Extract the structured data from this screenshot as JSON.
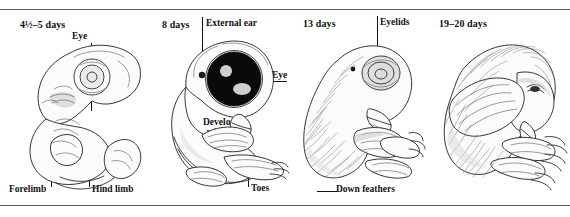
{
  "figure": {
    "background_color": "#ffffff",
    "rule_color": "#5a5a5a",
    "ink_color": "#2b2b2b"
  },
  "panels": [
    {
      "id": "panel-1",
      "stage_label": "4½–5 days",
      "subject": "chick embryo, curled, large unpigmented eye, limb buds",
      "labels": [
        {
          "name": "eye",
          "text": "Eye",
          "underlined": false
        },
        {
          "name": "forelimb",
          "text": "Forelimb",
          "underlined": false
        },
        {
          "name": "hind-limb",
          "text": "Hind limb",
          "underlined": false
        }
      ]
    },
    {
      "id": "panel-2",
      "stage_label": "8 days",
      "subject": "chick embryo with large black pigmented eye, beak, wing bud, toes",
      "labels": [
        {
          "name": "external-ear",
          "text": "External ear",
          "underlined": false
        },
        {
          "name": "eye",
          "text": "Eye",
          "underlined": true
        },
        {
          "name": "beak",
          "text": "Beak",
          "underlined": true
        },
        {
          "name": "developing-wing-bud",
          "text": "Developing wing bud",
          "line1": "Developing",
          "line2": "wing bud",
          "underlined": true
        },
        {
          "name": "toes",
          "text": "Toes",
          "underlined": false
        }
      ]
    },
    {
      "id": "panel-3",
      "stage_label": "13 days",
      "subject": "chick embryo with down feathers, closed eyelids, formed beak and claws",
      "labels": [
        {
          "name": "eyelids",
          "text": "Eyelids",
          "underlined": false
        },
        {
          "name": "down-feathers",
          "text": "Down feathers",
          "underlined": false
        }
      ]
    },
    {
      "id": "panel-4",
      "stage_label": "19–20 days",
      "subject": "fully feathered chick tucked head-down, ready to hatch",
      "labels": []
    }
  ]
}
